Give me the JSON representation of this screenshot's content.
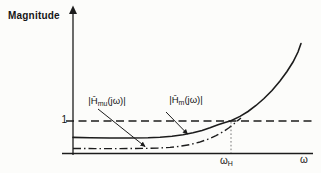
{
  "labels": {
    "magnitude": "Magnitude",
    "unity": "1",
    "hmu": {
      "pre": "|Ĥ",
      "sub": "mu",
      "post": "(jω)|"
    },
    "hm": {
      "pre": "|Ĥ",
      "sub": "m",
      "post": "(jω)|"
    },
    "cutoff": {
      "base": "ω",
      "sub": "H"
    },
    "omega": "ω"
  },
  "colors": {
    "ink": "#1c1c1c",
    "background": "#fcfcfa"
  },
  "chart_data": {
    "type": "line",
    "title": "",
    "xlabel": "ω",
    "ylabel": "Magnitude",
    "ylim": [
      0,
      3.6
    ],
    "grid": false,
    "legend_position": "inline arrows pointing from labels to curves",
    "y_ticks": [
      {
        "value": 1,
        "label": "1"
      }
    ],
    "x_ticks": [
      {
        "value": 1,
        "label": "ωH",
        "note": "marked by thin dotted vertical line where solid curve crosses magnitude 1"
      }
    ],
    "series": [
      {
        "name": "|Ĥm(jω)|",
        "style": "solid",
        "x": [
          0.05,
          0.2,
          0.35,
          0.5,
          0.6,
          0.7,
          0.8,
          0.9,
          0.95,
          1.0,
          1.1,
          1.2,
          1.3,
          1.4,
          1.5
        ],
        "y": [
          0.5,
          0.5,
          0.5,
          0.52,
          0.56,
          0.64,
          0.75,
          0.9,
          0.95,
          1.0,
          1.25,
          1.6,
          2.05,
          2.6,
          3.4
        ]
      },
      {
        "name": "|Ĥmu(jω)|",
        "style": "dash-dot",
        "x": [
          0.05,
          0.2,
          0.35,
          0.5,
          0.6,
          0.7,
          0.8,
          0.9,
          0.95,
          1.0,
          1.05
        ],
        "y": [
          0.17,
          0.17,
          0.18,
          0.22,
          0.28,
          0.4,
          0.58,
          0.8,
          0.92,
          1.05,
          1.15
        ],
        "note": "merges into |Ĥm(jω)| just above ωH"
      },
      {
        "name": "unity reference",
        "style": "dashed",
        "x": [
          0,
          1.55
        ],
        "y": [
          1,
          1
        ]
      }
    ]
  },
  "render": {
    "y_axis": [
      [
        73,
        155
      ],
      [
        73,
        12
      ]
    ],
    "y_arrowhead": [
      [
        69,
        14
      ],
      [
        73,
        5.5
      ],
      [
        77,
        14
      ]
    ],
    "x_axis": [
      [
        62,
        153.5
      ],
      [
        313,
        153.5
      ]
    ],
    "unity_line": [
      [
        66,
        121
      ],
      [
        314,
        121
      ]
    ],
    "solid_curve": [
      [
        73,
        137.4
      ],
      [
        90,
        137.8
      ],
      [
        110,
        138
      ],
      [
        130,
        138
      ],
      [
        148,
        137.7
      ],
      [
        160,
        137.2
      ],
      [
        172,
        136.2
      ],
      [
        183,
        134.7
      ],
      [
        193,
        132.8
      ],
      [
        202,
        130.4
      ],
      [
        210,
        127.7
      ],
      [
        218,
        124.7
      ],
      [
        225,
        122.4
      ],
      [
        231,
        120.8
      ],
      [
        240,
        116.4
      ],
      [
        248,
        111.5
      ],
      [
        256,
        105.5
      ],
      [
        264,
        98.5
      ],
      [
        272,
        90.5
      ],
      [
        280,
        81
      ],
      [
        287,
        71.5
      ],
      [
        293,
        62
      ],
      [
        298,
        52
      ],
      [
        301,
        43.5
      ]
    ],
    "dashdot_curve": [
      [
        73,
        148.5
      ],
      [
        95,
        148.6
      ],
      [
        120,
        148.6
      ],
      [
        145,
        148.4
      ],
      [
        158,
        148.1
      ],
      [
        170,
        147.4
      ],
      [
        180,
        146.3
      ],
      [
        190,
        144.6
      ],
      [
        199,
        142.3
      ],
      [
        208,
        139.2
      ],
      [
        216,
        135.6
      ],
      [
        223,
        131.8
      ],
      [
        229,
        127.8
      ],
      [
        234,
        123.8
      ],
      [
        238,
        120.4
      ],
      [
        241,
        118
      ]
    ],
    "cutoff_dotted": [
      [
        231,
        122
      ],
      [
        231,
        153
      ]
    ],
    "arrow_hmu": [
      [
        98,
        109
      ],
      [
        145,
        146.5
      ]
    ],
    "arrow_hm": [
      [
        166,
        112
      ],
      [
        187.5,
        134
      ]
    ]
  }
}
